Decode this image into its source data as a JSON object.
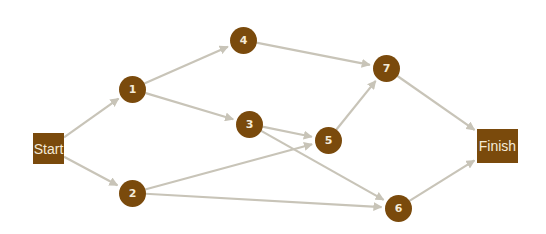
{
  "diagram": {
    "type": "activity-network",
    "colors": {
      "node_fill": "#7a4a0c",
      "node_text": "#f4ead8",
      "edge": "#c8c4b8",
      "background": "#ffffff"
    },
    "nodes": [
      {
        "id": "start",
        "label": "Start",
        "shape": "box",
        "x": 33,
        "y": 133,
        "w": 31,
        "h": 31
      },
      {
        "id": "1",
        "label": "1",
        "shape": "circle",
        "cx": 132,
        "cy": 89
      },
      {
        "id": "2",
        "label": "2",
        "shape": "circle",
        "cx": 132,
        "cy": 193
      },
      {
        "id": "3",
        "label": "3",
        "shape": "circle",
        "cx": 249,
        "cy": 124
      },
      {
        "id": "4",
        "label": "4",
        "shape": "circle",
        "cx": 243,
        "cy": 40
      },
      {
        "id": "5",
        "label": "5",
        "shape": "circle",
        "cx": 328,
        "cy": 140
      },
      {
        "id": "6",
        "label": "6",
        "shape": "circle",
        "cx": 398,
        "cy": 208
      },
      {
        "id": "7",
        "label": "7",
        "shape": "circle",
        "cx": 386,
        "cy": 68
      },
      {
        "id": "finish",
        "label": "Finish",
        "shape": "box",
        "x": 477,
        "y": 129,
        "w": 41,
        "h": 34
      }
    ],
    "edges": [
      {
        "from": "start",
        "to": "1"
      },
      {
        "from": "start",
        "to": "2"
      },
      {
        "from": "1",
        "to": "4"
      },
      {
        "from": "1",
        "to": "3"
      },
      {
        "from": "4",
        "to": "7"
      },
      {
        "from": "3",
        "to": "5"
      },
      {
        "from": "3",
        "to": "6"
      },
      {
        "from": "2",
        "to": "5"
      },
      {
        "from": "2",
        "to": "6"
      },
      {
        "from": "5",
        "to": "7"
      },
      {
        "from": "7",
        "to": "finish"
      },
      {
        "from": "6",
        "to": "finish"
      }
    ]
  }
}
